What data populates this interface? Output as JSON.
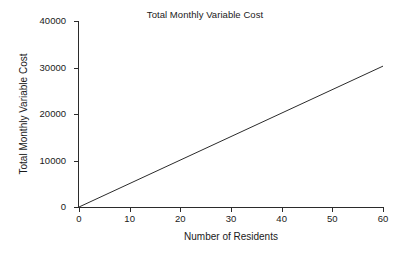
{
  "chart_data": {
    "type": "line",
    "title": "Total Monthly Variable Cost",
    "xlabel": "Number of Residents",
    "ylabel": "Total Monthly Variable Cost",
    "xlim": [
      0,
      60
    ],
    "ylim": [
      0,
      40000
    ],
    "xticks": [
      0,
      10,
      20,
      30,
      40,
      50,
      60
    ],
    "xtick_labels": [
      "0",
      "10",
      "20",
      "30",
      "40",
      "50",
      "60"
    ],
    "yticks": [
      0,
      10000,
      20000,
      30000,
      40000
    ],
    "ytick_labels": [
      "0",
      "10000",
      "20000",
      "30000",
      "40000"
    ],
    "grid": false,
    "legend": "none",
    "series": [
      {
        "name": "Total Monthly Variable Cost",
        "color": "#2b2b2b",
        "line_width": 1,
        "x": [
          0,
          60
        ],
        "values": [
          0,
          30300
        ]
      }
    ]
  },
  "figure": {
    "background_color": "#ffffff",
    "axis_color": "#2b2b2b",
    "text_color": "#1a1a1a"
  }
}
